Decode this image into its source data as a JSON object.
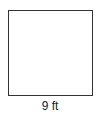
{
  "diagram": {
    "shape": "square",
    "side_label": "9 ft",
    "stroke_color": "#333333",
    "fill_color": "#ffffff"
  }
}
